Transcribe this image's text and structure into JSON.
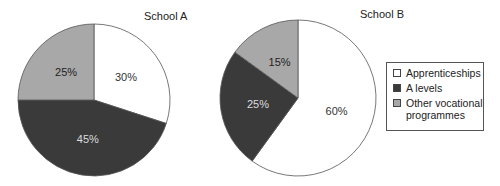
{
  "chart_data": [
    {
      "type": "pie",
      "title": "School A",
      "categories": [
        "Apprenticeships",
        "A levels",
        "Other vocational programmes"
      ],
      "values": [
        30,
        45,
        25
      ],
      "labels": [
        "30%",
        "45%",
        "25%"
      ],
      "colors": [
        "#ffffff",
        "#3a3a3a",
        "#a8a8a8"
      ]
    },
    {
      "type": "pie",
      "title": "School B",
      "categories": [
        "Apprenticeships",
        "A levels",
        "Other vocational programmes"
      ],
      "values": [
        60,
        25,
        15
      ],
      "labels": [
        "60%",
        "25%",
        "15%"
      ],
      "colors": [
        "#ffffff",
        "#3a3a3a",
        "#a8a8a8"
      ]
    }
  ],
  "legend": {
    "items": [
      {
        "label": "Apprenticeships",
        "color": "#ffffff"
      },
      {
        "label": "A levels",
        "color": "#3a3a3a"
      },
      {
        "label": "Other vocational programmes",
        "color": "#a8a8a8"
      }
    ],
    "position": "right"
  }
}
